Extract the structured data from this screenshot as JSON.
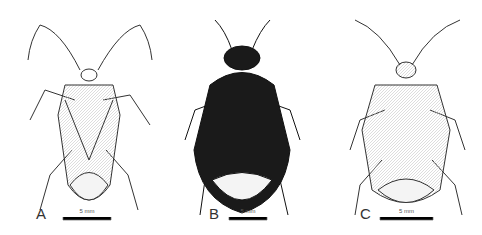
{
  "figure": {
    "panels": [
      {
        "label": "A",
        "scale": "5 mm"
      },
      {
        "label": "B",
        "scale": "5 mm"
      },
      {
        "label": "C",
        "scale": "5 mm"
      }
    ]
  }
}
